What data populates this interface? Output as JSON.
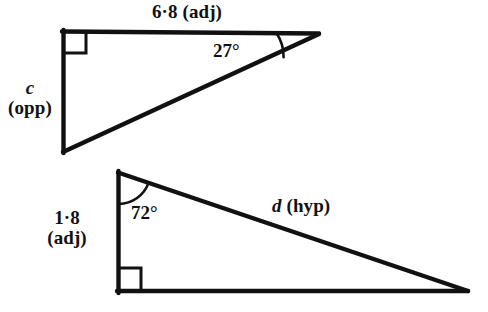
{
  "figure": {
    "background_color": "#ffffff",
    "stroke_color": "#111111"
  },
  "triangles": [
    {
      "id": "triangle-1",
      "description": "Right-angled triangle with the right angle at the top-left vertex",
      "right_angle_vertex": "top-left",
      "labels": {
        "top_side": "6·8 (adj)",
        "left_side_variable": "c",
        "left_side_role": "(opp)",
        "angle": "27°"
      },
      "vertices": {
        "top_left": [
          62,
          31
        ],
        "top_right": [
          318,
          33
        ],
        "bottom_left": [
          63,
          152
        ]
      }
    },
    {
      "id": "triangle-2",
      "description": "Right-angled triangle with the right angle at the bottom-left vertex",
      "right_angle_vertex": "bottom-left",
      "labels": {
        "left_side_value": "1·8",
        "left_side_role": "(adj)",
        "angle": "72°",
        "hypotenuse_variable": "d",
        "hypotenuse_role": "(hyp)"
      },
      "vertices": {
        "top_left": [
          117,
          172
        ],
        "bottom_left": [
          117,
          292
        ],
        "bottom_right": [
          467,
          292
        ]
      }
    }
  ]
}
